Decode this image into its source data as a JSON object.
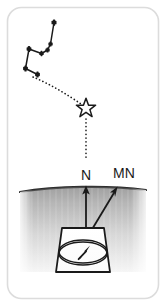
{
  "figure": {
    "card_background": "#ffffff",
    "card_border_color": "#d8d8d8",
    "ink_color": "#1a1a1a",
    "ground_color_top": "#8a8a8a",
    "ground_color_bottom": "#f2f2f2"
  },
  "labels": {
    "true_north": "N",
    "magnetic_north": "MN"
  },
  "constellation": {
    "name": "Big Dipper",
    "star_marker": "plus-star",
    "stars": [
      {
        "name": "Dubhe",
        "x": 29.0,
        "y": 49.0
      },
      {
        "name": "Merak",
        "x": 25.5,
        "y": 68.5
      },
      {
        "name": "Phecda",
        "x": 37.5,
        "y": 74.5
      },
      {
        "name": "Megrez",
        "x": 41.5,
        "y": 53.5
      },
      {
        "name": "Alioth",
        "x": 47.5,
        "y": 50.0
      },
      {
        "name": "Mizar",
        "x": 50.5,
        "y": 44.0
      },
      {
        "name": "Alkaid",
        "x": 54.0,
        "y": 22.5
      }
    ],
    "segments": [
      [
        0,
        1
      ],
      [
        1,
        2
      ],
      [
        0,
        3
      ],
      [
        3,
        4
      ],
      [
        4,
        5
      ],
      [
        5,
        6
      ]
    ]
  },
  "polaris": {
    "name": "Polaris",
    "marker": "open-star",
    "x": 86.0,
    "y": 107.0,
    "size": 9.5
  },
  "pointer_line": {
    "style": "dotted",
    "from_star_index": 0,
    "description": "curved dotted guide from the Big Dipper pointer stars to Polaris",
    "path": "M 33 77 C 50 84, 68 95, 81 104"
  },
  "polaris_drop_line": {
    "style": "dotted",
    "description": "dotted vertical line from Polaris down to the N label",
    "x": 86,
    "y_start": 117,
    "y_end": 158
  },
  "ground": {
    "left": 20,
    "right": 146,
    "top": 188,
    "bottom": 272,
    "ridge_description": "slightly curved dark horizon line"
  },
  "compass": {
    "shape": "trapezoid-case",
    "dial": "ellipse",
    "needle_description": "needle pointing up and to the right (toward magnetic north)",
    "case": {
      "top_left_x": 62,
      "top_right_x": 104,
      "top_y": 228,
      "bottom_left_x": 56,
      "bottom_right_x": 110,
      "bottom_y": 272
    },
    "dial_center_x": 83,
    "dial_center_y": 253,
    "dial_rx": 23,
    "dial_ry": 11
  },
  "arrows": [
    {
      "name": "true-north-arrow",
      "label": "N",
      "x1": 86,
      "y1": 228,
      "x2": 86,
      "y2": 187,
      "label_x": 85,
      "label_y": 175
    },
    {
      "name": "magnetic-north-arrow",
      "label": "MN",
      "x1": 79,
      "y1": 251,
      "x2": 117,
      "y2": 188,
      "label_x": 122,
      "label_y": 176
    }
  ]
}
